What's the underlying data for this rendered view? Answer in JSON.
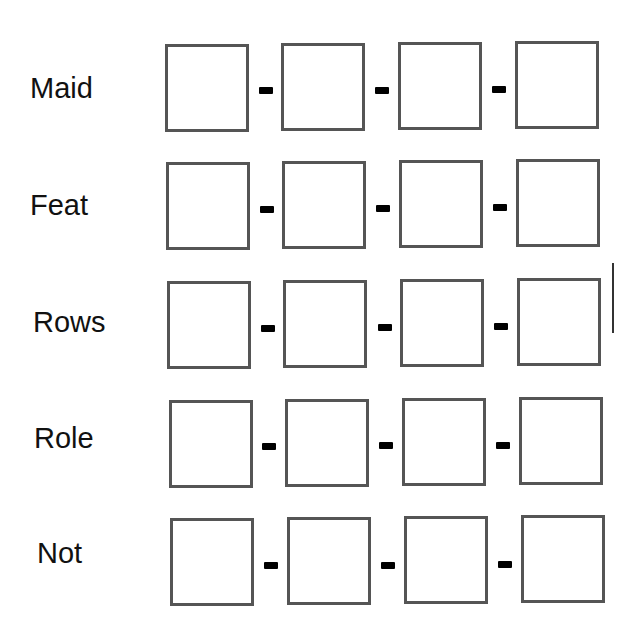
{
  "worksheet": {
    "rows": [
      {
        "word": "Maid",
        "boxes": [
          "",
          "",
          "",
          ""
        ]
      },
      {
        "word": "Feat",
        "boxes": [
          "",
          "",
          "",
          ""
        ]
      },
      {
        "word": "Rows",
        "boxes": [
          "",
          "",
          "",
          ""
        ]
      },
      {
        "word": "Role",
        "boxes": [
          "",
          "",
          "",
          ""
        ]
      },
      {
        "word": "Not",
        "boxes": [
          "",
          "",
          "",
          ""
        ]
      }
    ],
    "separator": "-"
  }
}
